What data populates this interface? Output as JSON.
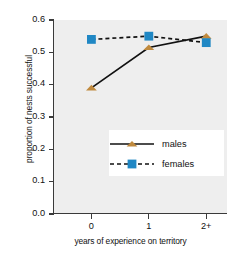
{
  "chart_data": {
    "type": "line",
    "title": "",
    "xlabel": "years of experience on territory",
    "ylabel": "proportion of nests successful",
    "categories": [
      "0",
      "1",
      "2+"
    ],
    "ylim": [
      0.0,
      0.6
    ],
    "yticks": [
      "0.0",
      "0.1",
      "0.2",
      "0.3",
      "0.4",
      "0.5",
      "0.6"
    ],
    "ytick_values": [
      0.0,
      0.1,
      0.2,
      0.3,
      0.4,
      0.5,
      0.6
    ],
    "grid": false,
    "legend_position": "lower-right-inside",
    "series": [
      {
        "name": "males",
        "values": [
          0.39,
          0.515,
          0.55
        ],
        "color": "#c08a3e",
        "line_style": "solid",
        "marker": "triangle"
      },
      {
        "name": "females",
        "values": [
          0.54,
          0.55,
          0.53
        ],
        "color": "#1f87c4",
        "line_style": "dashed",
        "marker": "square"
      }
    ]
  },
  "legend": {
    "items": [
      {
        "label": "males"
      },
      {
        "label": "females"
      }
    ]
  },
  "colors": {
    "males": "#c08a3e",
    "females": "#1f87c4",
    "line": "#111111",
    "plot_background": "#eeeeee",
    "figure_background": "#ffffff",
    "axis": "#3a3a3a"
  }
}
